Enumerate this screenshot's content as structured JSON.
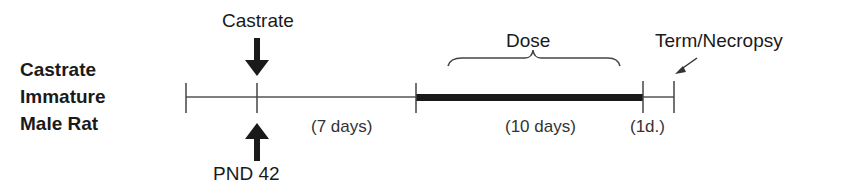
{
  "group": {
    "line1": "Castrate",
    "line2": "Immature",
    "line3": "Male Rat"
  },
  "events": {
    "castrate": "Castrate",
    "pnd": "PND 42",
    "dose": "Dose",
    "term": "Term/Necropsy"
  },
  "durations": {
    "pre": "(7 days)",
    "dose": "(10 days)",
    "post": "(1d.)"
  }
}
